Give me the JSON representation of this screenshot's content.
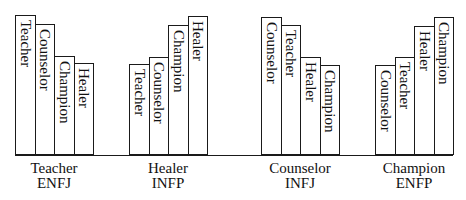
{
  "chart_data": {
    "type": "bar",
    "title": "",
    "xlabel": "",
    "ylabel": "",
    "grid": false,
    "legend": "none (bar labels written vertically inside bars)",
    "groups": [
      {
        "name": "Teacher",
        "type_code": "ENFJ",
        "bars": [
          {
            "label": "Teacher",
            "value": 140
          },
          {
            "label": "Counselor",
            "value": 131
          },
          {
            "label": "Champion",
            "value": 99
          },
          {
            "label": "Healer",
            "value": 92
          }
        ]
      },
      {
        "name": "Healer",
        "type_code": "INFP",
        "bars": [
          {
            "label": "Teacher",
            "value": 91
          },
          {
            "label": "Counselor",
            "value": 98
          },
          {
            "label": "Champion",
            "value": 130
          },
          {
            "label": "Healer",
            "value": 139
          }
        ]
      },
      {
        "name": "Counselor",
        "type_code": "INFJ",
        "bars": [
          {
            "label": "Counselor",
            "value": 138
          },
          {
            "label": "Teacher",
            "value": 130
          },
          {
            "label": "Healer",
            "value": 98
          },
          {
            "label": "Champion",
            "value": 90
          }
        ]
      },
      {
        "name": "Champion",
        "type_code": "ENFP",
        "bars": [
          {
            "label": "Counselor",
            "value": 90
          },
          {
            "label": "Teacher",
            "value": 98
          },
          {
            "label": "Healer",
            "value": 129
          },
          {
            "label": "Champion",
            "value": 138
          }
        ]
      }
    ],
    "categories": [
      "Teacher ENFJ",
      "Healer INFP",
      "Counselor INFJ",
      "Champion ENFP"
    ],
    "series": [
      {
        "name": "Teacher",
        "values": [
          140,
          91,
          130,
          98
        ]
      },
      {
        "name": "Counselor",
        "values": [
          131,
          98,
          138,
          90
        ]
      },
      {
        "name": "Champion",
        "values": [
          99,
          130,
          90,
          138
        ]
      },
      {
        "name": "Healer",
        "values": [
          92,
          139,
          98,
          129
        ]
      }
    ],
    "ylim": [
      0,
      145
    ]
  },
  "layout": {
    "baseline_y": 155,
    "bar_width": 19.5,
    "group_left": [
      15,
      129,
      261,
      375
    ]
  }
}
